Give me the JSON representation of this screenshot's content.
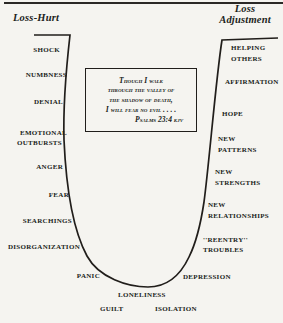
{
  "titles": {
    "left": "Loss-Hurt",
    "right_line1": "Loss",
    "right_line2": "Adjustment"
  },
  "quote": {
    "line1": "Though I walk",
    "line2": "through the valley of",
    "line3": "the shadow of death,",
    "line4": "I will fear no evil . . . .",
    "citation": "Psalms 23:4 kjv"
  },
  "labels": {
    "shock": "SHOCK",
    "numbness": "NUMBNESS",
    "denial": "DENIAL",
    "emotional": "EMOTIONAL",
    "outbursts": "OUTBURSTS",
    "anger": "ANGER",
    "fear": "FEAR",
    "searchings": "SEARCHINGS",
    "disorganization": "DISORGANIZATION",
    "panic": "PANIC",
    "loneliness": "LONELINESS",
    "guilt": "GUILT",
    "isolation": "ISOLATION",
    "depression": "DEPRESSION",
    "reentry_line1": "''REENTRY''",
    "reentry_line2": "TROUBLES",
    "new_relationships_line1": "NEW",
    "new_relationships_line2": "RELATIONSHIPS",
    "new_strengths_line1": "NEW",
    "new_strengths_line2": "STRENGTHS",
    "new_patterns_line1": "NEW",
    "new_patterns_line2": "PATTERNS",
    "hope": "HOPE",
    "affirmation": "AFFIRMATION",
    "helping": "HELPING",
    "others": "OTHERS"
  },
  "colors": {
    "ink": "#211e1b",
    "background": "#f5f4f0",
    "rule": "#2b2926"
  }
}
